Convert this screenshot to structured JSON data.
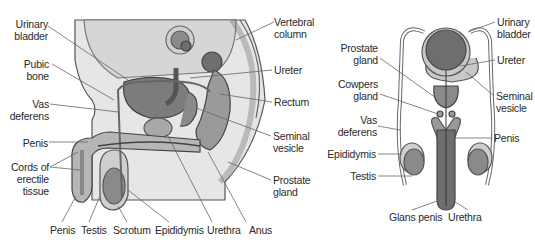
{
  "figure": {
    "left_panel": {
      "view": "sagittal",
      "labels": {
        "urinary_bladder": "Urinary\nbladder",
        "pubic_bone": "Pubic\nbone",
        "vas_deferens": "Vas\ndeferens",
        "penis_side": "Penis",
        "cords_erectile": "Cords of\nerectile\ntissue",
        "vertebral_column": "Vertebral\ncolumn",
        "ureter": "Ureter",
        "rectum": "Rectum",
        "seminal_vesicle": "Seminal\nvesicle",
        "prostate_gland": "Prostate\ngland",
        "bottom": [
          "Penis",
          "Testis",
          "Scrotum",
          "Epididymis",
          "Urethra",
          "Anus"
        ]
      }
    },
    "right_panel": {
      "view": "frontal",
      "labels": {
        "urinary_bladder": "Urinary\nbladder",
        "ureter": "Ureter",
        "seminal_vesicle": "Seminal\nvesicle",
        "penis": "Penis",
        "prostate_gland": "Prostate\ngland",
        "cowpers_gland": "Cowpers\ngland",
        "vas_deferens": "Vas\ndeferens",
        "epididymis": "Epididymis",
        "testis": "Testis",
        "glans_penis": "Glans penis",
        "urethra": "Urethra"
      }
    },
    "colors": {
      "body_fill": "#e4e4e4",
      "light_tissue": "#d2d2d2",
      "mid_tissue": "#a8a8a8",
      "dark_organ": "#7a7a7a",
      "outline": "#555555",
      "leader": "#666666",
      "text": "#2a2a2a"
    }
  }
}
